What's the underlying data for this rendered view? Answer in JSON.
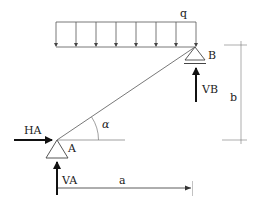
{
  "diagram": {
    "type": "structural-beam-free-body",
    "labels": {
      "load": "q",
      "support_a": "A",
      "support_b": "B",
      "reaction_ha": "HA",
      "reaction_va": "VA",
      "reaction_vb": "VB",
      "angle": "α",
      "dim_horizontal": "a",
      "dim_vertical": "b"
    },
    "load": {
      "kind": "uniform distributed",
      "arrow_count": 8,
      "direction": "down"
    },
    "colors": {
      "line": "#555555",
      "force_arrow": "#111111",
      "background": "#ffffff"
    }
  }
}
